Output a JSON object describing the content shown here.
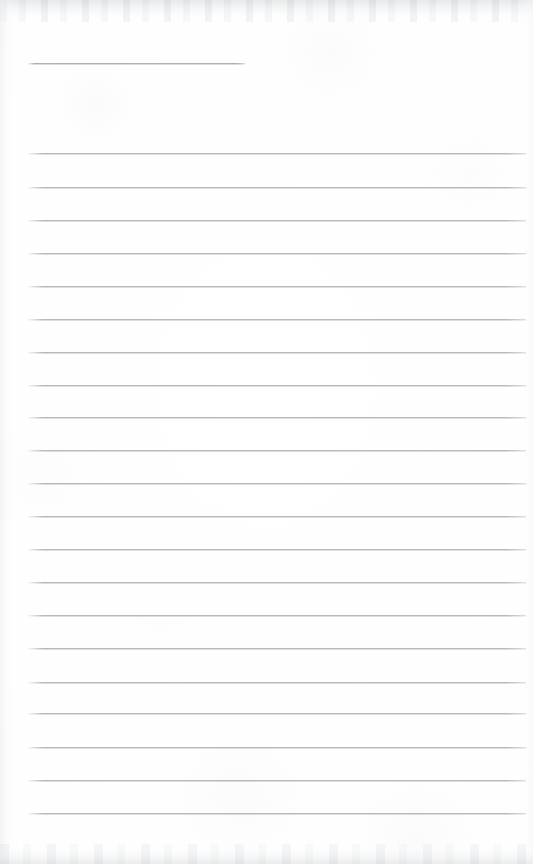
{
  "document": {
    "type": "scanned-lined-notepad-page",
    "title": "Blank ruled notepad page",
    "page_width": 533,
    "page_height": 864,
    "paper_color": "#fefefe",
    "rule_color": "#a8adb4",
    "content_text": "",
    "is_blank": true
  },
  "layout": {
    "rule_left_x": 28,
    "rule_right_x": 526,
    "rule_thickness": 2,
    "line_spacing": 32.8,
    "short_rule_right_x": 245
  },
  "rules": [
    {
      "name": "header-rule",
      "y": 63,
      "x": 28,
      "width": 217,
      "short": true
    },
    {
      "name": "rule-1",
      "y": 153,
      "x": 28,
      "width": 498,
      "short": false
    },
    {
      "name": "rule-2",
      "y": 187,
      "x": 28,
      "width": 498,
      "short": false
    },
    {
      "name": "rule-3",
      "y": 220,
      "x": 28,
      "width": 498,
      "short": false
    },
    {
      "name": "rule-4",
      "y": 253,
      "x": 28,
      "width": 498,
      "short": false
    },
    {
      "name": "rule-5",
      "y": 286,
      "x": 28,
      "width": 498,
      "short": false
    },
    {
      "name": "rule-6",
      "y": 319,
      "x": 28,
      "width": 498,
      "short": false
    },
    {
      "name": "rule-7",
      "y": 352,
      "x": 28,
      "width": 498,
      "short": false
    },
    {
      "name": "rule-8",
      "y": 385,
      "x": 28,
      "width": 498,
      "short": false
    },
    {
      "name": "rule-9",
      "y": 417,
      "x": 28,
      "width": 498,
      "short": false
    },
    {
      "name": "rule-10",
      "y": 450,
      "x": 28,
      "width": 498,
      "short": false
    },
    {
      "name": "rule-11",
      "y": 483,
      "x": 28,
      "width": 498,
      "short": false
    },
    {
      "name": "rule-12",
      "y": 516,
      "x": 28,
      "width": 498,
      "short": false
    },
    {
      "name": "rule-13",
      "y": 549,
      "x": 28,
      "width": 498,
      "short": false
    },
    {
      "name": "rule-14",
      "y": 582,
      "x": 28,
      "width": 498,
      "short": false
    },
    {
      "name": "rule-15",
      "y": 615,
      "x": 28,
      "width": 498,
      "short": false
    },
    {
      "name": "rule-16",
      "y": 648,
      "x": 28,
      "width": 498,
      "short": false
    },
    {
      "name": "rule-17",
      "y": 682,
      "x": 28,
      "width": 498,
      "short": false
    },
    {
      "name": "rule-18",
      "y": 713,
      "x": 28,
      "width": 498,
      "short": false
    },
    {
      "name": "rule-19",
      "y": 747,
      "x": 28,
      "width": 498,
      "short": false
    },
    {
      "name": "rule-20",
      "y": 780,
      "x": 28,
      "width": 498,
      "short": false
    },
    {
      "name": "rule-21",
      "y": 813,
      "x": 28,
      "width": 498,
      "short": false
    }
  ]
}
